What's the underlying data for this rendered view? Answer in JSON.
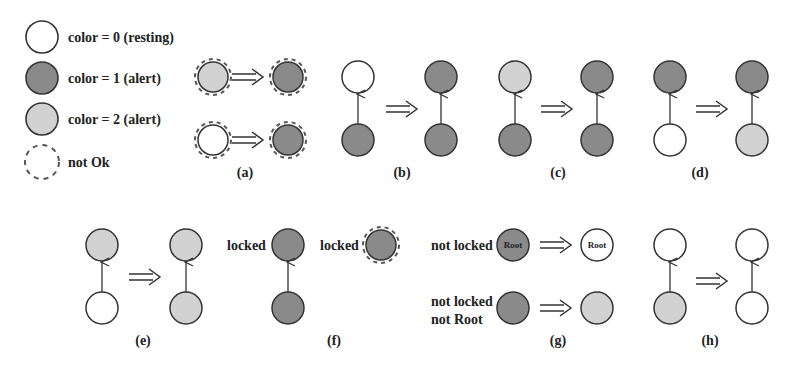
{
  "colors": {
    "resting": "#ffffff",
    "alert1": "#8a8a8a",
    "alert2": "#d2d2d2",
    "stroke": "#333333"
  },
  "legend": {
    "items": [
      {
        "label": "color = 0  (resting)"
      },
      {
        "label": "color = 1  (alert)"
      },
      {
        "label": "color = 2  (alert)"
      },
      {
        "label": "not Ok"
      }
    ]
  },
  "panels": {
    "a": {
      "caption": "(a)"
    },
    "b": {
      "caption": "(b)"
    },
    "c": {
      "caption": "(c)"
    },
    "d": {
      "caption": "(d)"
    },
    "e": {
      "caption": "(e)"
    },
    "f": {
      "caption": "(f)",
      "label_left": "locked",
      "label_right": "locked"
    },
    "g": {
      "caption": "(g)",
      "row1_label": "not locked",
      "row2_label_line1": "not locked",
      "row2_label_line2": "not Root",
      "root_text": "Root"
    },
    "h": {
      "caption": "(h)"
    }
  }
}
